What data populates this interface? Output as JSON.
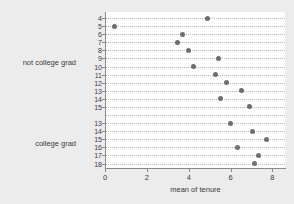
{
  "chart_data": {
    "type": "scatter",
    "title": "",
    "xlabel": "mean of tenure",
    "ylabel": "",
    "xlim": [
      0,
      8.6
    ],
    "xticks": [
      0,
      2,
      4,
      6,
      8
    ],
    "xticklabels": [
      "0",
      "2",
      "4",
      "6",
      "8"
    ],
    "grid": true,
    "grid_orientation": "horizontal",
    "legend": "none",
    "marker_color": "#6e6e6e",
    "panel_color": "#ffffff",
    "figure_color": "#ececec",
    "groups": [
      {
        "label": "not college grad",
        "categories": [
          "4",
          "5",
          "6",
          "7",
          "8",
          "9",
          "10",
          "11",
          "12",
          "13",
          "14",
          "15"
        ],
        "values": [
          4.9,
          0.46,
          3.68,
          3.45,
          4.0,
          5.4,
          4.23,
          5.28,
          5.8,
          6.5,
          5.5,
          6.9
        ]
      },
      {
        "label": "college grad",
        "categories": [
          "13",
          "14",
          "15",
          "16",
          "17",
          "18"
        ],
        "values": [
          6.0,
          7.05,
          7.7,
          6.35,
          7.35,
          7.15
        ]
      }
    ]
  }
}
